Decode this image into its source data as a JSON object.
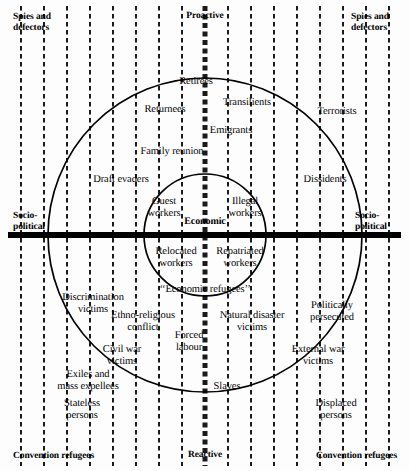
{
  "diagram": {
    "axes": {
      "top": "Proactive",
      "bottom": "Reactive",
      "left": "Socio-\npolitical",
      "right": "Socio-\npolitical",
      "center": "Economic"
    },
    "corners": {
      "top_left": "Spies and\ndefectors",
      "top_right": "Spies and\ndefectors",
      "bottom_left": "Convention refugees",
      "bottom_right": "Convention refugees"
    },
    "colors": {
      "ink": "#000000",
      "paper": "#fdfdfd",
      "grid": "#1a1a1a"
    },
    "grid": {
      "vertical_lines": 18,
      "spacing_px": 23,
      "dash_pattern": "4 3",
      "emphasized_center_line_x": 205
    },
    "circles": [
      {
        "name": "outer-circle",
        "cx": 205,
        "cy": 235,
        "r": 157
      },
      {
        "name": "inner-circle",
        "cx": 205,
        "cy": 235,
        "r": 61
      }
    ],
    "labels": [
      {
        "name": "label-retirees",
        "text": "Retirees",
        "x": 196,
        "y": 76,
        "align": "c"
      },
      {
        "name": "label-returnees",
        "text": "Returnees",
        "x": 165,
        "y": 104,
        "align": "c"
      },
      {
        "name": "label-transilients",
        "text": "Transilients",
        "x": 247,
        "y": 97,
        "align": "c"
      },
      {
        "name": "label-terrorists",
        "text": "Terrorists",
        "x": 337,
        "y": 106,
        "align": "c"
      },
      {
        "name": "label-emigrants",
        "text": "Emigrants",
        "x": 231,
        "y": 125,
        "align": "c"
      },
      {
        "name": "label-family-reunion",
        "text": "Family reunion",
        "x": 172,
        "y": 146,
        "align": "c"
      },
      {
        "name": "label-draft-evaders",
        "text": "Draft evaders",
        "x": 121,
        "y": 174,
        "align": "c"
      },
      {
        "name": "label-dissidents",
        "text": "Dissidents",
        "x": 325,
        "y": 174,
        "align": "c"
      },
      {
        "name": "label-guest-workers",
        "text": "Guest\nworkers",
        "x": 164,
        "y": 196,
        "align": "c"
      },
      {
        "name": "label-illegal-workers",
        "text": "Illegal\nworkers",
        "x": 245,
        "y": 196,
        "align": "c"
      },
      {
        "name": "label-relocated-workers",
        "text": "Relocated\nworkers",
        "x": 176,
        "y": 246,
        "align": "c"
      },
      {
        "name": "label-repatriated-workers",
        "text": "Repatriated\nworkers",
        "x": 240,
        "y": 246,
        "align": "c"
      },
      {
        "name": "label-economic-refugees",
        "text": "‘‘Economic refugees’’",
        "x": 205,
        "y": 284,
        "align": "c"
      },
      {
        "name": "label-discrimination-victims",
        "text": "Discrimination\nvictims",
        "x": 93,
        "y": 292,
        "align": "c"
      },
      {
        "name": "label-ethno-religious-conflict",
        "text": "Ethno-religious\nconflict",
        "x": 143,
        "y": 310,
        "align": "c"
      },
      {
        "name": "label-natural-disaster-victims",
        "text": "Natural disaster\nvictims",
        "x": 252,
        "y": 310,
        "align": "c"
      },
      {
        "name": "label-politically-persecuted",
        "text": "Politically\npersecuted",
        "x": 332,
        "y": 300,
        "align": "c"
      },
      {
        "name": "label-forced-labour",
        "text": "Forced\nlabour",
        "x": 189,
        "y": 330,
        "align": "c"
      },
      {
        "name": "label-civil-war-victims",
        "text": "Civil war\nvictims",
        "x": 122,
        "y": 344,
        "align": "c"
      },
      {
        "name": "label-external-war-victims",
        "text": "External war\nvictims",
        "x": 318,
        "y": 344,
        "align": "c"
      },
      {
        "name": "label-exiles-mass-expellees",
        "text": "Exiles and\nmass expellees",
        "x": 88,
        "y": 369,
        "align": "c"
      },
      {
        "name": "label-slaves",
        "text": "Slaves",
        "x": 227,
        "y": 381,
        "align": "c"
      },
      {
        "name": "label-stateless-persons",
        "text": "Stateless\npersons",
        "x": 82,
        "y": 398,
        "align": "c"
      },
      {
        "name": "label-displaced-persons",
        "text": "Displaced\npersons",
        "x": 336,
        "y": 398,
        "align": "c"
      }
    ]
  }
}
